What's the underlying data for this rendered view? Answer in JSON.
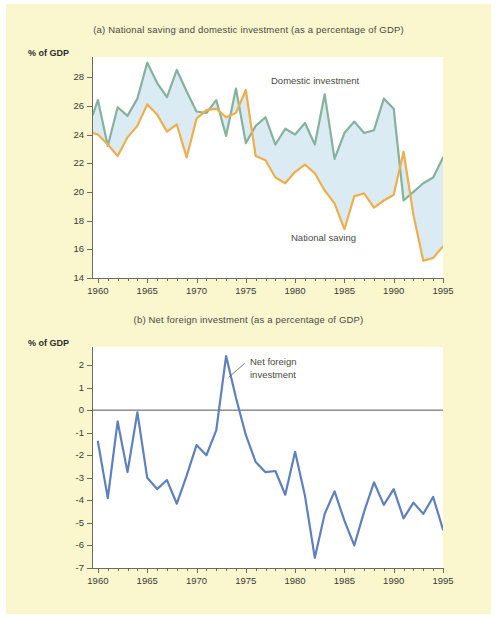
{
  "figure": {
    "background_color": "#faf6ce",
    "plot_background": "#ffffff"
  },
  "panel_a": {
    "title": "(a) National saving and domestic investment (as a percentage of GDP)",
    "axis_caption": "% of GDP",
    "annotations": {
      "domestic_investment": "Domestic investment",
      "national_saving": "National saving"
    }
  },
  "panel_b": {
    "title": "(b) Net foreign investment (as a percentage of GDP)",
    "axis_caption": "% of GDP",
    "annotations": {
      "net_foreign_investment_line1": "Net foreign",
      "net_foreign_investment_line2": "investment"
    }
  },
  "chart_data": [
    {
      "id": "panel-a",
      "type": "line",
      "title": "(a) National saving and domestic investment (as a percentage of GDP)",
      "xlabel": "",
      "ylabel": "% of GDP",
      "xlim": [
        1959.5,
        1995
      ],
      "ylim": [
        14,
        29.4
      ],
      "ytick_labels": [
        "14",
        "16",
        "18",
        "20",
        "22",
        "24",
        "26",
        "28"
      ],
      "yticks": [
        14,
        16,
        18,
        20,
        22,
        24,
        26,
        28
      ],
      "xtick_labels": [
        "1960",
        "1965",
        "1970",
        "1975",
        "1980",
        "1985",
        "1990",
        "1995"
      ],
      "xticks": [
        1960,
        1965,
        1970,
        1975,
        1980,
        1985,
        1990,
        1995
      ],
      "grid": false,
      "legend": "inline-annotation",
      "fill_between": {
        "color": "#dbebf4",
        "upper_series": "Domestic investment",
        "lower_series": "National saving"
      },
      "x": [
        1959.5,
        1960,
        1961,
        1962,
        1963,
        1964,
        1965,
        1966,
        1967,
        1968,
        1969,
        1970,
        1971,
        1972,
        1973,
        1974,
        1975,
        1976,
        1977,
        1978,
        1979,
        1980,
        1981,
        1982,
        1983,
        1984,
        1985,
        1986,
        1987,
        1988,
        1989,
        1990,
        1991,
        1992,
        1993,
        1994,
        1995
      ],
      "series": [
        {
          "name": "Domestic investment",
          "color": "#86b29c",
          "values": [
            25.4,
            26.4,
            23.2,
            25.9,
            25.3,
            26.5,
            29.0,
            27.6,
            26.6,
            28.5,
            27.0,
            25.6,
            25.5,
            26.4,
            23.9,
            27.2,
            23.4,
            24.6,
            25.2,
            23.3,
            24.4,
            24.0,
            24.8,
            23.3,
            26.8,
            22.3,
            24.1,
            24.9,
            24.1,
            24.3,
            26.5,
            25.8,
            19.4,
            20.0,
            20.6,
            21.0,
            22.4
          ]
        },
        {
          "name": "National saving",
          "color": "#efae4c",
          "values": [
            24.1,
            24.0,
            23.3,
            22.5,
            23.8,
            24.6,
            26.1,
            25.4,
            24.2,
            24.7,
            22.4,
            25.1,
            25.7,
            25.8,
            25.2,
            25.5,
            27.1,
            22.5,
            22.2,
            21.0,
            20.6,
            21.4,
            21.9,
            21.3,
            20.1,
            19.2,
            17.4,
            19.7,
            19.9,
            18.9,
            19.4,
            19.8,
            22.8,
            18.4,
            15.2,
            15.4,
            16.2,
            17.0,
            17.0
          ]
        }
      ]
    },
    {
      "id": "panel-b",
      "type": "line",
      "title": "(b) Net foreign investment (as a percentage of GDP)",
      "xlabel": "",
      "ylabel": "% of GDP",
      "xlim": [
        1959.5,
        1995
      ],
      "ylim": [
        -7,
        2.8
      ],
      "ytick_labels": [
        "2",
        "1",
        "0",
        "-1",
        "-2",
        "-3",
        "-4",
        "-5",
        "-6",
        "-7"
      ],
      "yticks": [
        2,
        1,
        0,
        -1,
        -2,
        -3,
        -4,
        -5,
        -6,
        -7
      ],
      "xtick_labels": [
        "1960",
        "1965",
        "1970",
        "1975",
        "1980",
        "1985",
        "1990",
        "1995"
      ],
      "xticks": [
        1960,
        1965,
        1970,
        1975,
        1980,
        1985,
        1990,
        1995
      ],
      "grid": false,
      "zero_line": true,
      "zero_line_color": "#555555",
      "legend": "inline-annotation",
      "x": [
        1960,
        1961,
        1962,
        1963,
        1964,
        1965,
        1966,
        1967,
        1968,
        1969,
        1970,
        1971,
        1972,
        1973,
        1974,
        1975,
        1976,
        1977,
        1978,
        1979,
        1980,
        1981,
        1982,
        1983,
        1984,
        1985,
        1986,
        1987,
        1988,
        1989,
        1990,
        1991,
        1992,
        1993,
        1994,
        1995
      ],
      "series": [
        {
          "name": "Net foreign investment",
          "color": "#5e80bd",
          "values": [
            -1.4,
            -3.9,
            -0.5,
            -2.75,
            -0.1,
            -3.0,
            -3.5,
            -3.1,
            -4.15,
            -2.9,
            -1.55,
            -2.0,
            -0.9,
            2.4,
            0.55,
            -1.1,
            -2.3,
            -2.75,
            -2.7,
            -3.75,
            -1.85,
            -3.8,
            -6.55,
            -4.6,
            -3.6,
            -4.9,
            -6.0,
            -4.5,
            -3.2,
            -4.2,
            -3.5,
            -4.8,
            -4.1,
            -4.6,
            -3.85,
            -5.3
          ]
        }
      ]
    }
  ]
}
